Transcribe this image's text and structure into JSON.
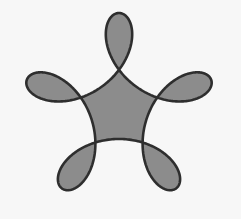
{
  "diagram": {
    "type": "five-lobed looped curve (knot-like flower)",
    "lobes": 5,
    "inner_loops": 5,
    "colors": {
      "background": "#f7f7f7",
      "fill": "#8c8c8c",
      "stroke": "#2e2e2e"
    },
    "geometry": {
      "center_x": 119,
      "center_y": 110,
      "outer_radius_term": 63,
      "loop_radius_term": 34,
      "stroke_width": 2.6,
      "rotation_deg": -90
    }
  }
}
